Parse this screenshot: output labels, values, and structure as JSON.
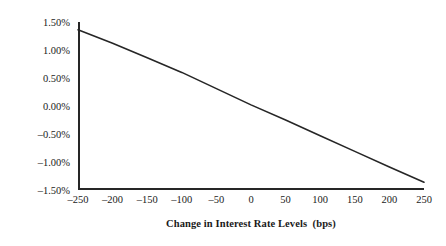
{
  "chart_data": {
    "type": "line",
    "title": "",
    "xlabel": "Change in Interest Rate Levels  (bps)",
    "ylabel": "Percentage Change in MCS Price",
    "xlim": [
      -250,
      250
    ],
    "ylim": [
      -1.5,
      1.5
    ],
    "grid": false,
    "legend": null,
    "x_tick_labels": [
      "–250",
      "–200",
      "–150",
      "–100",
      "–50",
      "0",
      "50",
      "100",
      "150",
      "200",
      "250"
    ],
    "x_ticks": [
      -250,
      -200,
      -150,
      -100,
      -50,
      0,
      50,
      100,
      150,
      200,
      250
    ],
    "y_tick_labels": [
      "1.50%",
      "1.00%",
      "0.50%",
      "0.00%",
      "–0.50%",
      "–1.00%",
      "–1.50%"
    ],
    "y_ticks": [
      1.5,
      1.0,
      0.5,
      0.0,
      -0.5,
      -1.0,
      -1.5
    ],
    "series": [
      {
        "name": "Percentage Change in MCS Price",
        "color": "#262626",
        "x": [
          -250,
          -200,
          -150,
          -100,
          -50,
          0,
          50,
          100,
          150,
          200,
          250
        ],
        "values": [
          1.36,
          1.12,
          0.86,
          0.6,
          0.31,
          0.02,
          -0.25,
          -0.53,
          -0.81,
          -1.09,
          -1.36
        ]
      }
    ]
  },
  "axes": {
    "y_title": "Percentage Change in MCS Price",
    "x_title": "Change in Interest Rate Levels  (bps)"
  }
}
